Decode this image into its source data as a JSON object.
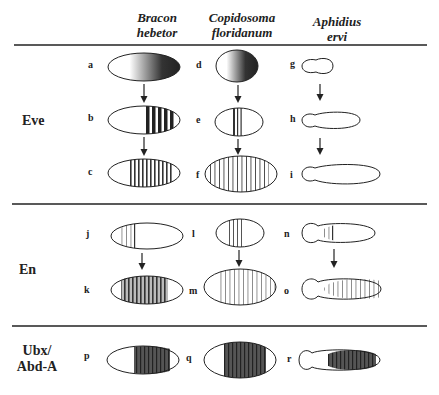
{
  "columns": [
    {
      "line1": "Bracon",
      "line2": "hebetor"
    },
    {
      "line1": "Copidosoma",
      "line2": "floridanum"
    },
    {
      "line1": "Aphidius",
      "line2": "ervi"
    }
  ],
  "rows": [
    {
      "label_line1": "Eve",
      "label_line2": ""
    },
    {
      "label_line1": "En",
      "label_line2": ""
    },
    {
      "label_line1": "Ubx/",
      "label_line2": "Abd-A"
    }
  ],
  "panels": {
    "a": "a",
    "b": "b",
    "c": "c",
    "d": "d",
    "e": "e",
    "f": "f",
    "g": "g",
    "h": "h",
    "i": "i",
    "j": "j",
    "k": "k",
    "l": "l",
    "m": "m",
    "n": "n",
    "o": "o",
    "p": "p",
    "q": "q",
    "r": "r"
  },
  "colors": {
    "ink": "#222222",
    "stripe_light": "#555555",
    "background": "#ffffff"
  }
}
